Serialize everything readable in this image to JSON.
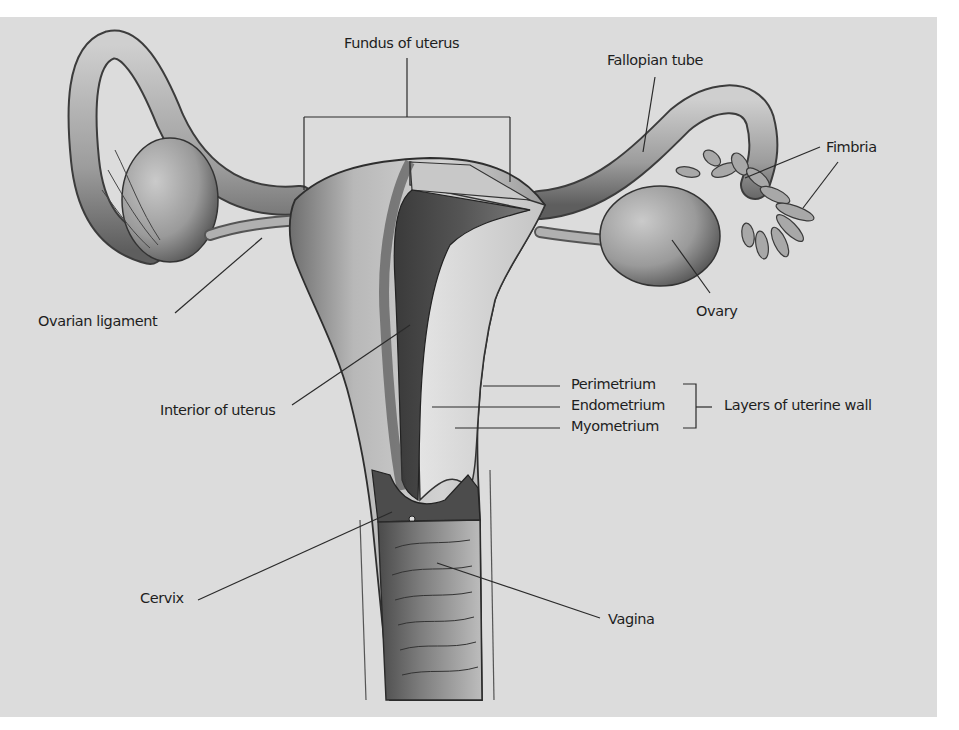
{
  "figure": {
    "background_color": "#dcdcdc",
    "label_color": "#1e1e1e",
    "leader_line_color": "#2a2a2a"
  },
  "labels": {
    "fundus": "Fundus of uterus",
    "fallopian_tube": "Fallopian tube",
    "fimbria": "Fimbria",
    "ovarian_ligament": "Ovarian ligament",
    "ovary": "Ovary",
    "interior_of_uterus": "Interior of uterus",
    "perimetrium": "Perimetrium",
    "endometrium": "Endometrium",
    "myometrium": "Myometrium",
    "layers_of_uterine_wall": "Layers of uterine wall",
    "cervix": "Cervix",
    "vagina": "Vagina"
  }
}
